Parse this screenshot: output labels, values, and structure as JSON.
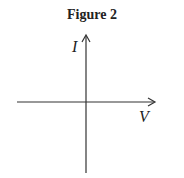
{
  "figure": {
    "title": "Figure 2",
    "y_axis_label": "I",
    "x_axis_label": "V",
    "axis_color": "#333333"
  }
}
